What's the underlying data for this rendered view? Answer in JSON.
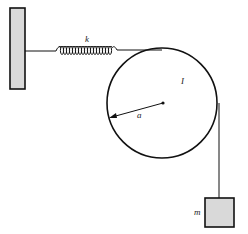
{
  "diagram": {
    "labels": {
      "spring_constant": "k",
      "moment_of_inertia": "I",
      "radius": "a",
      "mass": "m"
    },
    "colors": {
      "line": "#111111",
      "fill_gray": "#d9d9d9",
      "background": "#ffffff"
    }
  }
}
